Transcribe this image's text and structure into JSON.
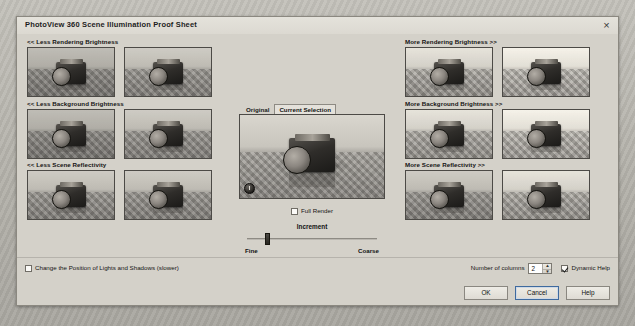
{
  "window": {
    "title": "PhotoView 360 Scene Illumination Proof Sheet",
    "close_icon": "×"
  },
  "left_groups": [
    {
      "label": "<< Less Rendering Brightness",
      "name": "less-rendering-brightness",
      "thumbs": [
        "thumb-less-rendering-2",
        "thumb-less-rendering-1"
      ]
    },
    {
      "label": "<< Less Background Brightness",
      "name": "less-background-brightness",
      "thumbs": [
        "thumb-less-background-2",
        "thumb-less-background-1"
      ]
    },
    {
      "label": "<< Less Scene Reflectivity",
      "name": "less-scene-reflectivity",
      "thumbs": [
        "thumb-less-reflectivity-2",
        "thumb-less-reflectivity-1"
      ]
    }
  ],
  "right_groups": [
    {
      "label": "More Rendering Brightness >>",
      "name": "more-rendering-brightness",
      "thumbs": [
        "thumb-more-rendering-1",
        "thumb-more-rendering-2"
      ]
    },
    {
      "label": "More Background Brightness >>",
      "name": "more-background-brightness",
      "thumbs": [
        "thumb-more-background-1",
        "thumb-more-background-2"
      ]
    },
    {
      "label": "More Scene Reflectivity >>",
      "name": "more-scene-reflectivity",
      "thumbs": [
        "thumb-more-reflectivity-1",
        "thumb-more-reflectivity-2"
      ]
    }
  ],
  "center": {
    "tabs": [
      {
        "label": "Original",
        "active": false
      },
      {
        "label": "Current Selection",
        "active": true
      }
    ],
    "preview_icon": "timer-icon",
    "full_render": {
      "label": "Full Render",
      "checked": false
    },
    "increment": {
      "label": "Increment",
      "min_label": "Fine",
      "max_label": "Coarse",
      "value": 18
    }
  },
  "bottom": {
    "lights_shadows": {
      "label": "Change the Position of Lights and Shadows (slower)",
      "checked": false
    },
    "num_columns": {
      "label": "Number of columns",
      "value": "2",
      "up_glyph": "▲",
      "down_glyph": "▼"
    },
    "dynamic_help": {
      "label": "Dynamic Help",
      "checked": true
    },
    "buttons": [
      {
        "label": "OK",
        "name": "ok-button",
        "default": false
      },
      {
        "label": "Cancel",
        "name": "cancel-button",
        "default": true
      },
      {
        "label": "Help",
        "name": "help-button",
        "default": false
      }
    ]
  }
}
